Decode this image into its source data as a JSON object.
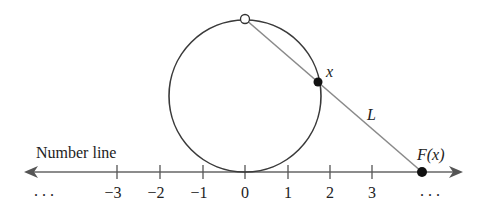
{
  "diagram": {
    "title_label": "Number line",
    "left_ellipsis": ". . .",
    "right_ellipsis": ". . .",
    "ticks": [
      {
        "value": -3,
        "label": "−3"
      },
      {
        "value": -2,
        "label": "−2"
      },
      {
        "value": -1,
        "label": "−1"
      },
      {
        "value": 0,
        "label": "0"
      },
      {
        "value": 1,
        "label": "1"
      },
      {
        "value": 2,
        "label": "2"
      },
      {
        "value": 3,
        "label": "3"
      }
    ],
    "point_on_circle_label": "x",
    "line_label": "L",
    "projection_label": "F(x)",
    "colors": {
      "circle": "#3a3a3a",
      "axis": "#555555",
      "secant_line": "#8a8a8a",
      "filled_point": "#111111",
      "open_point_fill": "#ffffff"
    }
  }
}
